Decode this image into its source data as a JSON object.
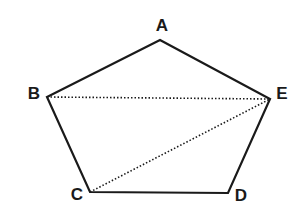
{
  "diagram": {
    "stroke_color": "#1a1a1a",
    "vertices": [
      {
        "name": "A",
        "x": 160,
        "y": 40,
        "label_x": 162,
        "label_y": 30
      },
      {
        "name": "B",
        "x": 47,
        "y": 97,
        "label_x": 34,
        "label_y": 99
      },
      {
        "name": "C",
        "x": 90,
        "y": 192,
        "label_x": 77,
        "label_y": 201
      },
      {
        "name": "D",
        "x": 228,
        "y": 193,
        "label_x": 240,
        "label_y": 202
      },
      {
        "name": "E",
        "x": 270,
        "y": 99,
        "label_x": 282,
        "label_y": 99
      }
    ],
    "solid_edges": [
      [
        "A",
        "B"
      ],
      [
        "B",
        "C"
      ],
      [
        "C",
        "D"
      ],
      [
        "D",
        "E"
      ],
      [
        "E",
        "A"
      ]
    ],
    "dotted_edges": [
      [
        "B",
        "E"
      ],
      [
        "C",
        "E"
      ]
    ],
    "labels": {
      "A": "A",
      "B": "B",
      "C": "C",
      "D": "D",
      "E": "E"
    }
  }
}
